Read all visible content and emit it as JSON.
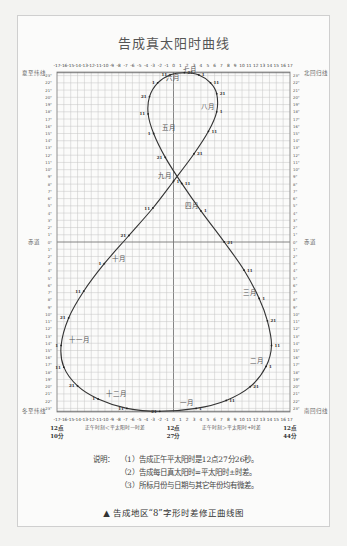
{
  "title": "告成真太阳时曲线",
  "chart_data": {
    "type": "line",
    "title": "告成真太阳时曲线",
    "subtitle": "告成地区“8”字形时差修正曲线图",
    "xlabel_left": "正午时刻＜平太阳时—时差",
    "xlabel_right": "正午时刻＞平太阳时+时差",
    "x_ticks": [
      -17,
      -16,
      -15,
      -14,
      -13,
      -12,
      -11,
      -10,
      -9,
      -8,
      -7,
      -6,
      -5,
      -4,
      -3,
      -2,
      -1,
      0,
      1,
      2,
      3,
      4,
      5,
      6,
      7,
      8,
      9,
      10,
      11,
      12,
      13,
      14,
      15,
      16,
      17
    ],
    "x_unit": "minutes offset",
    "x_time_labels": [
      {
        "x": -17,
        "line1": "12点",
        "line2": "10分"
      },
      {
        "x": 0,
        "line1": "12点",
        "line2": "27分"
      },
      {
        "x": 17,
        "line1": "12点",
        "line2": "44分"
      }
    ],
    "y_labels": {
      "top": "夏至纬线",
      "top_right": "北回归线",
      "middle": "赤道",
      "bottom": "冬至纬线",
      "bottom_right": "南回归线"
    },
    "ylim": [
      -23.5,
      23.5
    ],
    "xlim": [
      -17,
      17
    ],
    "grid": true,
    "month_labels": [
      "一月",
      "二月",
      "三月",
      "四月",
      "五月",
      "六月",
      "七月",
      "八月",
      "九月",
      "十月",
      "十一月",
      "十二月"
    ],
    "series": [
      {
        "name": "analemma",
        "points": [
          {
            "month": "一月",
            "day": 1,
            "x": 3.3,
            "y": -23.0
          },
          {
            "month": "一月",
            "day": 11,
            "x": 7.7,
            "y": -21.9
          },
          {
            "month": "一月",
            "day": 21,
            "x": 11.2,
            "y": -20.0
          },
          {
            "month": "二月",
            "day": 1,
            "x": 13.5,
            "y": -17.2
          },
          {
            "month": "二月",
            "day": 11,
            "x": 14.3,
            "y": -14.3
          },
          {
            "month": "二月",
            "day": 21,
            "x": 13.7,
            "y": -10.9
          },
          {
            "month": "三月",
            "day": 1,
            "x": 12.5,
            "y": -7.8
          },
          {
            "month": "三月",
            "day": 11,
            "x": 10.3,
            "y": -3.9
          },
          {
            "month": "三月",
            "day": 21,
            "x": 7.4,
            "y": 0.0
          },
          {
            "month": "四月",
            "day": 1,
            "x": 4.0,
            "y": 4.3
          },
          {
            "month": "四月",
            "day": 11,
            "x": 1.2,
            "y": 8.1
          },
          {
            "month": "四月",
            "day": 21,
            "x": -1.2,
            "y": 11.7
          },
          {
            "month": "五月",
            "day": 1,
            "x": -2.9,
            "y": 15.0
          },
          {
            "month": "五月",
            "day": 11,
            "x": -3.7,
            "y": 17.7
          },
          {
            "month": "五月",
            "day": 21,
            "x": -3.5,
            "y": 20.1
          },
          {
            "month": "六月",
            "day": 1,
            "x": -2.3,
            "y": 22.0
          },
          {
            "month": "六月",
            "day": 11,
            "x": -0.5,
            "y": 23.1
          },
          {
            "month": "六月",
            "day": 21,
            "x": 1.6,
            "y": 23.4
          },
          {
            "month": "七月",
            "day": 1,
            "x": 3.7,
            "y": 23.1
          },
          {
            "month": "七月",
            "day": 11,
            "x": 5.4,
            "y": 22.0
          },
          {
            "month": "七月",
            "day": 21,
            "x": 6.3,
            "y": 20.5
          },
          {
            "month": "八月",
            "day": 1,
            "x": 6.3,
            "y": 18.0
          },
          {
            "month": "八月",
            "day": 11,
            "x": 5.1,
            "y": 15.3
          },
          {
            "month": "八月",
            "day": 21,
            "x": 3.0,
            "y": 12.2
          },
          {
            "month": "九月",
            "day": 1,
            "x": 0.0,
            "y": 8.4
          },
          {
            "month": "九月",
            "day": 11,
            "x": -3.0,
            "y": 4.7
          },
          {
            "month": "九月",
            "day": 21,
            "x": -6.5,
            "y": 0.9
          },
          {
            "month": "十月",
            "day": 1,
            "x": -10.1,
            "y": -3.0
          },
          {
            "month": "十月",
            "day": 11,
            "x": -13.1,
            "y": -6.8
          },
          {
            "month": "十月",
            "day": 21,
            "x": -15.3,
            "y": -10.5
          },
          {
            "month": "十一月",
            "day": 1,
            "x": -16.4,
            "y": -14.3
          },
          {
            "month": "十一月",
            "day": 11,
            "x": -16.0,
            "y": -17.3
          },
          {
            "month": "十一月",
            "day": 21,
            "x": -14.0,
            "y": -19.9
          },
          {
            "month": "十二月",
            "day": 1,
            "x": -11.0,
            "y": -21.7
          },
          {
            "month": "十二月",
            "day": 11,
            "x": -6.8,
            "y": -23.0
          },
          {
            "month": "十二月",
            "day": 21,
            "x": -2.0,
            "y": -23.4
          },
          {
            "month": "一月",
            "day": 1,
            "x": 3.3,
            "y": -23.0
          }
        ]
      }
    ]
  },
  "notes": {
    "label": "说明：",
    "items": [
      "（1）告成正午平太阳时是12点27分26秒。",
      "（2）告成每日真太阳时=平太阳时±时差。",
      "（3）所标月份与日期与其它年份均有微差。"
    ]
  },
  "caption": "▲ 告成地区“8”字形时差修正曲线图"
}
